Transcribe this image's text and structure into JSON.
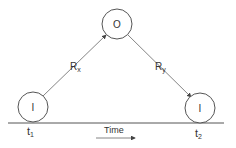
{
  "diagram": {
    "nodes": [
      {
        "id": "start",
        "label": "I",
        "time_label": "t",
        "time_sub": "1"
      },
      {
        "id": "other",
        "label": "O"
      },
      {
        "id": "end",
        "label": "I",
        "time_label": "t",
        "time_sub": "2"
      }
    ],
    "edges": [
      {
        "from": "start",
        "to": "other",
        "label": "R",
        "sub": "x"
      },
      {
        "from": "other",
        "to": "end",
        "label": "R",
        "sub": "y"
      }
    ],
    "axis": {
      "label": "Time"
    },
    "colors": {
      "stroke": "#555555",
      "text": "#333333",
      "background": "#ffffff"
    }
  }
}
